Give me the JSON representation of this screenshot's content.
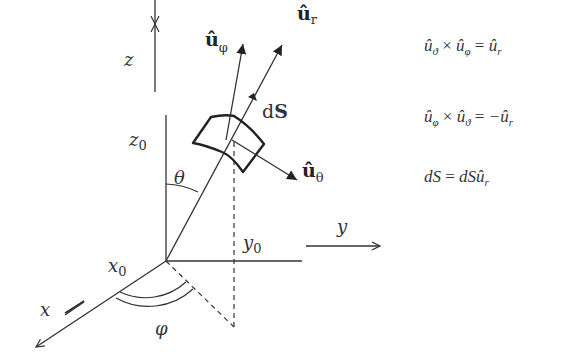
{
  "diagram": {
    "axes": {
      "z_label": "z",
      "y_label": "y",
      "x_label": "x",
      "z0_label": "z",
      "z0_sub": "0",
      "y0_label": "y",
      "y0_sub": "0",
      "x0_label": "x",
      "x0_sub": "0"
    },
    "angles": {
      "theta_label": "θ",
      "phi_label": "φ"
    },
    "vectors": {
      "u_phi_label": "û",
      "u_phi_sub": "φ",
      "u_r_label": "û",
      "u_r_sub": "r",
      "u_theta_label": "û",
      "u_theta_sub": "θ",
      "dS_prefix": "d",
      "dS_bold": "S"
    },
    "equations": [
      "û_ϑ × û_φ = û_r",
      "û_φ × û_ϑ = −û_r",
      "dS = dSû_r"
    ],
    "equation_parts": {
      "eq1": {
        "a": "û",
        "a_sub": "ϑ",
        "op": " × ",
        "b": "û",
        "b_sub": "φ",
        "eq": " = ",
        "c": "û",
        "c_sub": "r"
      },
      "eq2": {
        "a": "û",
        "a_sub": "φ",
        "op": " × ",
        "b": "û",
        "b_sub": "ϑ",
        "eq": " = ",
        "c": "−û",
        "c_sub": "r"
      },
      "eq3": {
        "lhs": "dS",
        "eq": " = ",
        "rhs": "dSû",
        "rhs_sub": "r"
      }
    },
    "colors": {
      "line": "#333333",
      "background": "#ffffff"
    }
  }
}
